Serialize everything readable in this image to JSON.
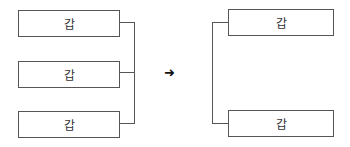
{
  "diagram": {
    "left_group": {
      "boxes": [
        {
          "label": "갑"
        },
        {
          "label": "갑"
        },
        {
          "label": "갑"
        }
      ]
    },
    "arrow": "➜",
    "right_group": {
      "boxes": [
        {
          "label": "갑"
        },
        {
          "label": "갑"
        }
      ]
    }
  }
}
